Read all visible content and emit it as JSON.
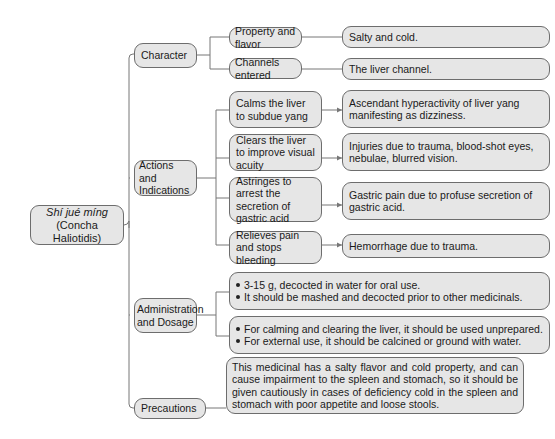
{
  "root": {
    "title": "Shí jué míng",
    "subtitle": "(Concha Haliotidis)"
  },
  "branches": {
    "character": {
      "label": "Character",
      "items": [
        {
          "label": "Property and flavor",
          "value": "Salty and cold."
        },
        {
          "label": "Channels entered",
          "value": "The liver channel."
        }
      ]
    },
    "actions": {
      "label": "Actions and Indications",
      "items": [
        {
          "label": "Calms the liver to subdue yang",
          "value": "Ascendant hyperactivity of liver yang manifesting as dizziness."
        },
        {
          "label": "Clears the liver to improve visual acuity",
          "value": "Injuries due to trauma, blood-shot eyes, nebulae, blurred vision."
        },
        {
          "label": "Astringes to arrest the secretion of gastric acid",
          "value": "Gastric pain due to profuse secretion of gastric acid."
        },
        {
          "label": "Relieves pain and stops bleeding",
          "value": "Hemorrhage due to trauma."
        }
      ]
    },
    "administration": {
      "label": "Administration and Dosage",
      "groups": [
        {
          "bullets": [
            "3-15 g, decocted in water for oral use.",
            "It should be mashed and decocted prior to other medicinals."
          ]
        },
        {
          "bullets": [
            "For calming and clearing the liver, it should be used unprepared.",
            "For external use, it should be calcined or ground with water."
          ]
        }
      ]
    },
    "precautions": {
      "label": "Precautions",
      "text": "This medicinal has a salty flavor and cold property, and can cause impairment to the spleen and stomach, so it should be given cautiously in cases of deficiency cold in the spleen and stomach with poor appetite and loose stools."
    }
  },
  "colors": {
    "box_fill": "#e6e6e6",
    "box_border": "#6d6d6d",
    "connector": "#6d6d6d"
  }
}
